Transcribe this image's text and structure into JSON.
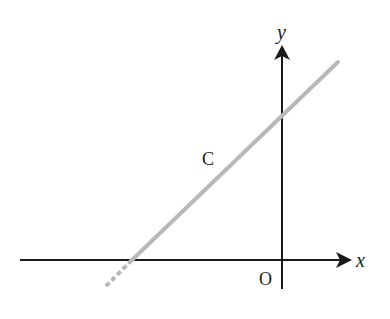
{
  "diagram": {
    "type": "coordinate-plane-with-line",
    "axes": {
      "x_label": "x",
      "y_label": "y",
      "origin_label": "O"
    },
    "line": {
      "label": "C",
      "color": "#b8b8b8",
      "description": "straight line with positive slope, crossing the negative x-axis and the positive y-axis; dashed below the x-axis"
    },
    "colors": {
      "axis": "#1a1a1a",
      "line": "#b8b8b8",
      "background": "#ffffff"
    }
  }
}
